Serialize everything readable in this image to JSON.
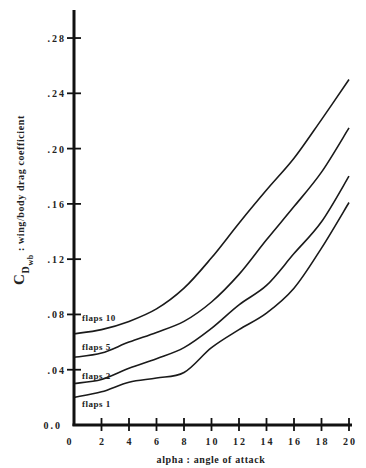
{
  "chart_data": {
    "type": "line",
    "title": "",
    "xlabel": "alpha : angle of attack",
    "ylabel_main": "C",
    "ylabel_sub": "D",
    "ylabel_subsub": "wb",
    "ylabel_text": " : wing/body drag coefficient",
    "ylabel": "C_D_wb : wing/body drag coefficient",
    "xlim": [
      0,
      20
    ],
    "ylim": [
      0,
      0.3
    ],
    "x_ticks": [
      0,
      2,
      4,
      6,
      8,
      10,
      12,
      14,
      16,
      18,
      20
    ],
    "x_tick_labels": [
      "0",
      "2",
      "4",
      "6",
      "8",
      "10",
      "12",
      "14",
      "16",
      "18",
      "20"
    ],
    "y_ticks": [
      0.0,
      0.04,
      0.08,
      0.12,
      0.16,
      0.2,
      0.24,
      0.28
    ],
    "y_tick_labels": [
      "0.0",
      ".04",
      ".08",
      ".12",
      ".16",
      ".20",
      ".24",
      ".28"
    ],
    "grid": false,
    "legend": "inline labels at left of curves",
    "x": [
      0,
      2,
      4,
      6,
      8,
      10,
      12,
      14,
      16,
      18,
      20
    ],
    "series": [
      {
        "name": "flaps 10",
        "label": "flaps 10",
        "values": [
          0.066,
          0.069,
          0.075,
          0.084,
          0.099,
          0.121,
          0.146,
          0.17,
          0.193,
          0.221,
          0.25
        ]
      },
      {
        "name": "flaps 5",
        "label": "flaps 5",
        "values": [
          0.049,
          0.052,
          0.06,
          0.067,
          0.075,
          0.089,
          0.109,
          0.134,
          0.158,
          0.183,
          0.215
        ]
      },
      {
        "name": "flaps 2",
        "label": "flaps 2",
        "values": [
          0.03,
          0.033,
          0.041,
          0.048,
          0.056,
          0.07,
          0.087,
          0.101,
          0.124,
          0.147,
          0.18
        ]
      },
      {
        "name": "flaps 1",
        "label": "flaps 1",
        "values": [
          0.02,
          0.024,
          0.031,
          0.034,
          0.038,
          0.056,
          0.069,
          0.081,
          0.099,
          0.128,
          0.161
        ]
      }
    ],
    "label_positions": [
      {
        "series": "flaps 10",
        "y": 0.075
      },
      {
        "series": "flaps 5",
        "y": 0.054
      },
      {
        "series": "flaps 2",
        "y": 0.033
      },
      {
        "series": "flaps 1",
        "y": 0.013
      }
    ]
  }
}
